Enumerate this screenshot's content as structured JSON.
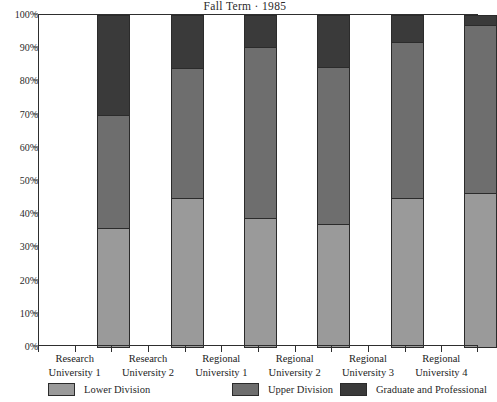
{
  "chart_data": {
    "type": "bar",
    "subtype": "stacked-percentage",
    "title": "Fall Term · 1985",
    "xlabel": "",
    "ylabel": "",
    "ylim": [
      0,
      100
    ],
    "grid": false,
    "legend_position": "bottom",
    "categories": [
      "Research University 1",
      "Research University 2",
      "Regional University 1",
      "Regional University 2",
      "Regional University 3",
      "Regional University 4"
    ],
    "category_lines": [
      [
        "Research",
        "University 1"
      ],
      [
        "Research",
        "University 2"
      ],
      [
        "Regional",
        "University 1"
      ],
      [
        "Regional",
        "University 2"
      ],
      [
        "Regional",
        "University 3"
      ],
      [
        "Regional",
        "University 4"
      ]
    ],
    "series": [
      {
        "name": "Lower Division",
        "color": "#9a9a9a",
        "values": [
          36,
          45,
          39,
          37,
          45,
          46.5
        ]
      },
      {
        "name": "Upper Division",
        "color": "#6e6e6e",
        "values": [
          34,
          39,
          51.5,
          47.5,
          47,
          50.5
        ]
      },
      {
        "name": "Graduate and Professional",
        "color": "#3a3a3a",
        "values": [
          30,
          16,
          9.5,
          15.5,
          8,
          3
        ]
      }
    ],
    "y_ticks": [
      {
        "value": 100,
        "label": "100%"
      },
      {
        "value": 90,
        "label": "90%"
      },
      {
        "value": 80,
        "label": "80%"
      },
      {
        "value": 70,
        "label": "70%"
      },
      {
        "value": 60,
        "label": "60%"
      },
      {
        "value": 50,
        "label": "50%"
      },
      {
        "value": 40,
        "label": "40%"
      },
      {
        "value": 30,
        "label": "30%"
      },
      {
        "value": 20,
        "label": "20%"
      },
      {
        "value": 10,
        "label": "10%"
      },
      {
        "value": 0,
        "label": "0%"
      }
    ],
    "legend": [
      {
        "label": "Lower Division",
        "color": "#9a9a9a"
      },
      {
        "label": "Upper Division",
        "color": "#6e6e6e"
      },
      {
        "label": "Graduate and Professional",
        "color": "#3a3a3a"
      }
    ]
  }
}
